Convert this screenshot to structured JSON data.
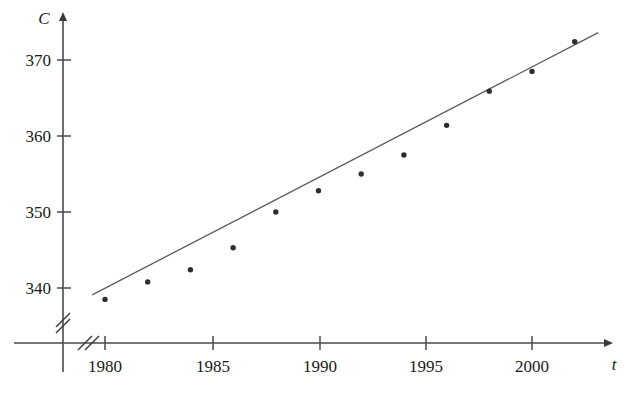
{
  "chart_data": {
    "type": "scatter",
    "title": "",
    "subtitle": "",
    "xlabel": "t",
    "ylabel": "C",
    "x": [
      1980,
      1982,
      1984,
      1986,
      1988,
      1990,
      1992,
      1994,
      1996,
      1998,
      2000,
      2002
    ],
    "values": [
      338.5,
      340.8,
      342.4,
      345.3,
      350.0,
      352.8,
      355.0,
      357.5,
      361.4,
      365.9,
      368.5,
      372.4
    ],
    "series": [
      {
        "name": "CO2 level",
        "values": [
          338.5,
          340.8,
          342.4,
          345.3,
          350.0,
          352.8,
          355.0,
          357.5,
          361.4,
          365.9,
          368.5,
          372.4
        ]
      }
    ],
    "xticks": [
      1980,
      1985,
      1990,
      1995,
      2000
    ],
    "xtick_labels": [
      "1980",
      "1985",
      "1990",
      "1995",
      "2000"
    ],
    "yticks": [
      340,
      350,
      360,
      370
    ],
    "ytick_labels": [
      "340",
      "350",
      "360",
      "370"
    ],
    "xlim": [
      1978.7,
      2003.5
    ],
    "ylim": [
      336.0,
      374.5
    ],
    "grid": false,
    "legend": "none",
    "axis_break_x": true,
    "axis_break_y": true,
    "trend_line": {
      "type": "linear regression",
      "x_start": 1979.4,
      "y_start": 339.1,
      "x_end": 2003.1,
      "y_end": 373.6
    },
    "marker": "dot",
    "annotations": []
  },
  "axes": {
    "y_axis_label": "C",
    "x_axis_label": "t"
  }
}
